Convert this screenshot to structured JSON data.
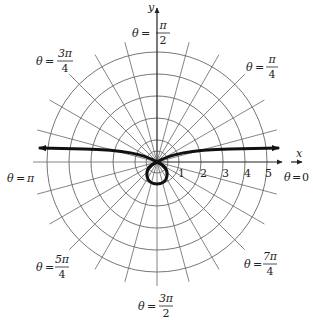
{
  "diagram": {
    "type": "polar-graph",
    "axes": {
      "x_label": "x",
      "y_label": "y"
    },
    "radial_ticks": [
      "1",
      "2",
      "3",
      "4",
      "5"
    ],
    "angle_labels": {
      "zero": {
        "theta": "θ",
        "eq": "=",
        "value": "0"
      },
      "pi_over_4": {
        "theta": "θ",
        "eq": "=",
        "num": "π",
        "den": "4"
      },
      "pi_over_2": {
        "theta": "θ",
        "eq": "=",
        "num": "π",
        "den": "2"
      },
      "three_pi_over_4": {
        "theta": "θ",
        "eq": "=",
        "num": "3π",
        "den": "4"
      },
      "pi": {
        "theta": "θ",
        "eq": "=",
        "value": "π"
      },
      "five_pi_over_4": {
        "theta": "θ",
        "eq": "=",
        "num": "5π",
        "den": "4"
      },
      "three_pi_over_2": {
        "theta": "θ",
        "eq": "=",
        "num": "3π",
        "den": "2"
      },
      "seven_pi_over_4": {
        "theta": "θ",
        "eq": "=",
        "num": "7π",
        "den": "4"
      }
    },
    "grid": {
      "circles": 5,
      "radial_step_degrees": 15
    },
    "colors": {
      "grid": "#555555",
      "curve": "#111111",
      "axis": "#222222"
    }
  }
}
